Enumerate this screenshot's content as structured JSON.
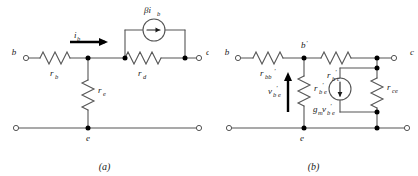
{
  "figure": {
    "colors": {
      "wire": "#555555",
      "ink": "#1a1a1a",
      "node": "#000000",
      "background": "#ffffff"
    }
  },
  "circuit_a": {
    "caption": "(a)",
    "terminals": [
      {
        "name": "base",
        "label": "b"
      },
      {
        "name": "collector",
        "label": "c"
      },
      {
        "name": "emitter",
        "label": "e"
      }
    ],
    "components": [
      {
        "name": "base-resistor",
        "label": "r",
        "subscript": "b",
        "orientation": "horizontal"
      },
      {
        "name": "diffusion-resistor",
        "label": "r",
        "subscript": "d",
        "orientation": "horizontal"
      },
      {
        "name": "emitter-resistor",
        "label": "r",
        "subscript": "e",
        "orientation": "vertical"
      }
    ],
    "sources": [
      {
        "name": "dependent-current-source",
        "label": "βi",
        "subscript": "b",
        "direction": "right"
      }
    ],
    "currents": [
      {
        "name": "base-current",
        "label": "i",
        "subscript": "b",
        "direction": "right"
      }
    ]
  },
  "circuit_b": {
    "caption": "(b)",
    "terminals": [
      {
        "name": "base",
        "label": "b"
      },
      {
        "name": "internal-base",
        "label": "b",
        "prime": "′"
      },
      {
        "name": "collector",
        "label": "c"
      },
      {
        "name": "emitter",
        "label": "e"
      }
    ],
    "components": [
      {
        "name": "base-spreading-resistor",
        "label": "r",
        "subscript": "bb",
        "prime": "′",
        "orientation": "horizontal"
      },
      {
        "name": "base-collector-resistor",
        "label": "r",
        "subscript": "b",
        "prime": "′",
        "subscript2": "c",
        "orientation": "horizontal"
      },
      {
        "name": "base-emitter-resistor",
        "label": "r",
        "subscript": "b",
        "prime": "′",
        "subscript2": "e",
        "orientation": "vertical"
      },
      {
        "name": "collector-emitter-resistor",
        "label": "r",
        "subscript": "ce",
        "orientation": "vertical"
      }
    ],
    "sources": [
      {
        "name": "transconductance-current-source",
        "label": "g",
        "subscript": "m",
        "label2": "v",
        "subscript2": "b",
        "prime": "′",
        "subscript3": "e",
        "direction": "down"
      }
    ],
    "voltages": [
      {
        "name": "base-emitter-voltage",
        "label": "v",
        "subscript": "b",
        "prime": "′",
        "subscript2": "e",
        "direction": "up"
      }
    ]
  }
}
